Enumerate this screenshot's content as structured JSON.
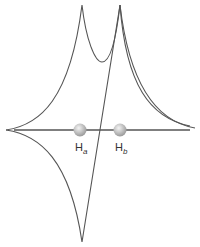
{
  "diagram": {
    "type": "potential-energy-curves",
    "nuclei": [
      {
        "label": "H",
        "subscript": "a",
        "x": 80
      },
      {
        "label": "H",
        "subscript": "b",
        "x": 120
      }
    ],
    "colors": {
      "line": "#555555",
      "nucleus": "#bbbbbb"
    }
  }
}
